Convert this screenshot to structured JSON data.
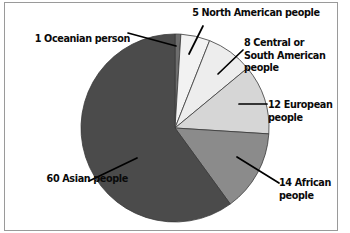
{
  "page": {
    "background_color": "#ffffff",
    "frame_color": "#9a9a9a"
  },
  "chart_data": {
    "type": "pie",
    "title": "",
    "total": 100,
    "unit": "people",
    "start_angle_deg": 0,
    "direction": "clockwise",
    "legend": "none",
    "grid": false,
    "categories": [
      "Oceanian",
      "North American",
      "Central or South American",
      "European",
      "African",
      "Asian"
    ],
    "values": [
      1,
      5,
      8,
      12,
      14,
      60
    ],
    "labels": [
      "1 Oceanian person",
      "5 North American people",
      "8 Central or\nSouth American\npeople",
      "12 European\npeople",
      "14 African\npeople",
      "60 Asian people"
    ],
    "colors": [
      "#6e6e6e",
      "#f2f2f2",
      "#ededed",
      "#d6d6d6",
      "#8b8b8b",
      "#4b4b4b"
    ],
    "slice_outline_color": "#3a3a3a",
    "leader_line_color": "#000000"
  },
  "labels": {
    "oceanian": "1 Oceanian person",
    "north_american": "5 North American people",
    "central_south_american": "8 Central or\nSouth American\npeople",
    "european": "12 European\npeople",
    "african": "14 African\npeople",
    "asian": "60 Asian people"
  }
}
